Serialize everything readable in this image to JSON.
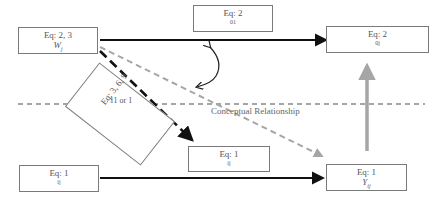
{
  "diagram": {
    "boxes": {
      "top_left": {
        "eq": "Eq: 2, 3",
        "var": "W",
        "var_sub": "j"
      },
      "top_middle": {
        "eq": "Eq: 2",
        "var": "01"
      },
      "top_right": {
        "eq": "Eq: 2",
        "var": "0j"
      },
      "rotated": {
        "eq": "Eq: 3, 6, 9",
        "var": "11 or 1"
      },
      "bottom_left": {
        "eq": "Eq: 1",
        "var": "ij"
      },
      "bottom_middle": {
        "eq": "Eq: 1",
        "var": "ij"
      },
      "bottom_right": {
        "eq": "Eq: 1",
        "var": "Y",
        "var_sub": "ij"
      }
    },
    "divider_label": "Conceptual Relationship",
    "colors": {
      "solid_arrow": "#111111",
      "gray_dashed_arrow": "#a6a6a6",
      "gray_solid_arrow": "#a6a6a6",
      "divider": "#888888",
      "box_border": "#7a7a7a"
    }
  }
}
